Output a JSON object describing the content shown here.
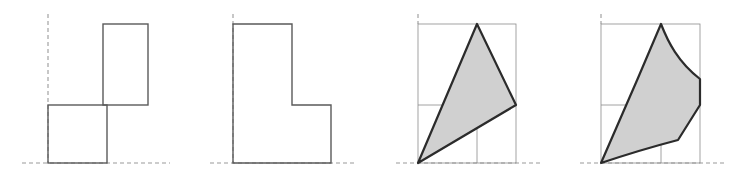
{
  "figure": {
    "title": "",
    "caption": "",
    "panel_count": 4,
    "canvas": {
      "width": 740,
      "height": 174
    },
    "style": {
      "stroke_dark": "#5a5a5a",
      "stroke_outline": "#2b2b2b",
      "stroke_thin": "#8c8c8c",
      "dash_color": "#9a9a9a",
      "shade_fill": "#d0d0d0",
      "background": "#ffffff",
      "stroke_width_shape": 1.4,
      "stroke_width_outline": 2.2,
      "stroke_width_thin": 0.8,
      "dash_pattern": "4 3"
    },
    "panels": [
      {
        "name": "pinwheel-rectangles",
        "label": "",
        "type": "outline",
        "shaded": false,
        "origin": {
          "x": 48,
          "y": 163
        },
        "axes": {
          "vertical_dashed": {
            "x": 48,
            "y1": 14,
            "y2": 163
          },
          "horizontal_dashed": {
            "y": 163,
            "x1": 22,
            "x2": 170
          }
        },
        "shapes": [
          {
            "name": "upper-rectangle",
            "x1": 103,
            "y1": 24,
            "x2": 148,
            "y2": 105
          },
          {
            "name": "lower-rectangle",
            "x1": 48,
            "y1": 105,
            "x2": 107,
            "y2": 163
          }
        ]
      },
      {
        "name": "l-shaped-polygon",
        "label": "",
        "type": "outline",
        "shaded": false,
        "origin": {
          "x": 233,
          "y": 163
        },
        "axes": {
          "vertical_dashed": {
            "x": 233,
            "y1": 14,
            "y2": 163
          },
          "horizontal_dashed": {
            "y": 163,
            "x1": 210,
            "x2": 355
          }
        },
        "shapes": [
          {
            "name": "l-polygon",
            "points": "233,24 292,24 292,105 331,105 331,163 233,163"
          }
        ]
      },
      {
        "name": "shaded-triangle",
        "label": "",
        "type": "polygon",
        "shaded": true,
        "origin": {
          "x": 418,
          "y": 163
        },
        "axes": {
          "vertical_dashed": {
            "x": 418,
            "y1": 14,
            "y2": 24
          },
          "horizontal_dashed": {
            "y": 163,
            "x1": 396,
            "x2": 540
          }
        },
        "reference_box": {
          "x1": 418,
          "y1": 24,
          "x2": 516,
          "y2": 163
        },
        "reference_lines": {
          "horizontal": {
            "y": 105,
            "x1": 418,
            "x2": 516
          },
          "vertical": {
            "x": 477,
            "y1": 24,
            "y2": 163
          }
        },
        "shapes": [
          {
            "name": "triangle",
            "points": "418,163 477,24 516,105"
          }
        ],
        "vertices": [
          {
            "name": "bottom-left",
            "x": 418,
            "y": 163
          },
          {
            "name": "apex",
            "x": 477,
            "y": 24
          },
          {
            "name": "right",
            "x": 516,
            "y": 105
          }
        ]
      },
      {
        "name": "shaded-curved-region",
        "label": "",
        "type": "curve",
        "shaded": true,
        "origin": {
          "x": 601,
          "y": 163
        },
        "axes": {
          "vertical_dashed": {
            "x": 601,
            "y1": 14,
            "y2": 24
          },
          "horizontal_dashed": {
            "y": 163,
            "x1": 580,
            "x2": 726
          }
        },
        "reference_box": {
          "x1": 601,
          "y1": 24,
          "x2": 700,
          "y2": 163
        },
        "reference_lines": {
          "horizontal": {
            "y": 105,
            "x1": 601,
            "x2": 700
          },
          "vertical": {
            "x": 661,
            "y1": 24,
            "y2": 163
          }
        },
        "shapes": [
          {
            "name": "curved-region",
            "path": "M 601,163 L 638,78 L 661,24 C 668,42 678,62 700,79 L 700,105 L 678,140 C 655,146 625,155 601,163 Z"
          }
        ],
        "vertices": [
          {
            "name": "bottom-left",
            "x": 601,
            "y": 163
          },
          {
            "name": "apex",
            "x": 661,
            "y": 24
          },
          {
            "name": "right",
            "x": 700,
            "y": 105
          }
        ],
        "bend_points": [
          {
            "name": "left-edge-bend",
            "x": 638,
            "y": 78
          },
          {
            "name": "right-edge-inflection",
            "x": 700,
            "y": 79
          },
          {
            "name": "bottom-edge-bend",
            "x": 678,
            "y": 140
          }
        ]
      }
    ]
  }
}
